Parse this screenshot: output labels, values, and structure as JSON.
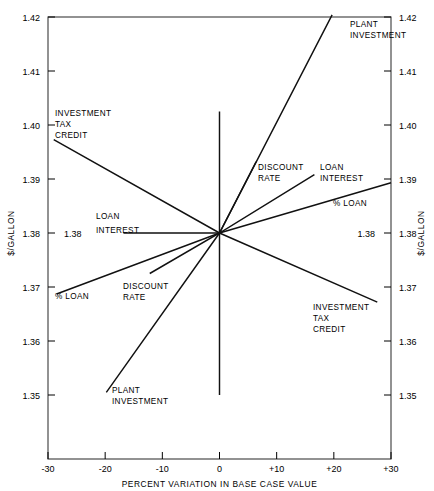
{
  "chart_data": {
    "type": "line",
    "title": "",
    "xlabel": "PERCENT VARIATION IN BASE CASE VALUE",
    "ylabel": "$/GALLON",
    "xlim": [
      -30,
      30
    ],
    "ylim": [
      1.3445,
      1.4225
    ],
    "grid": false,
    "legend_position": "inline-annotations",
    "x_ticks": [
      "-30",
      "-20",
      "-10",
      "0",
      "+10",
      "+20",
      "+30"
    ],
    "x_tick_values": [
      -30,
      -20,
      -10,
      0,
      10,
      20,
      30
    ],
    "y_ticks": [
      "1.35",
      "1.36",
      "1.37",
      "1.38",
      "1.39",
      "1.40",
      "1.41",
      "1.42"
    ],
    "y_tick_values": [
      1.35,
      1.36,
      1.37,
      1.38,
      1.39,
      1.4,
      1.41,
      1.42
    ],
    "base_case_value": 1.38,
    "base_case_label": "1.38",
    "series": [
      {
        "name": "PLANT INVESTMENT",
        "x": [
          -19.8,
          0,
          19.7
        ],
        "values": [
          1.3505,
          1.38,
          1.4204
        ],
        "label_left": "PLANT\nINVESTMENT",
        "label_right": "PLANT\nINVESTMENT"
      },
      {
        "name": "INVESTMENT TAX CREDIT",
        "x": [
          -29.0,
          0,
          27.6
        ],
        "values": [
          1.3973,
          1.38,
          1.3672
        ],
        "label_left": "INVESTMENT\nTAX\nCREDIT",
        "label_right": "INVESTMENT\nTAX\nCREDIT"
      },
      {
        "name": "DISCOUNT RATE",
        "x": [
          -12.2,
          0,
          6.4
        ],
        "values": [
          1.3725,
          1.38,
          1.3932
        ],
        "label_left": "DISCOUNT\nRATE",
        "label_right": "DISCOUNT\nRATE"
      },
      {
        "name": "LOAN INTEREST",
        "x": [
          -16.8,
          0,
          16.6
        ],
        "values": [
          1.38,
          1.38,
          1.3908
        ],
        "label_left": "LOAN\nINTEREST",
        "label_right": "LOAN\nINTEREST"
      },
      {
        "name": "% LOAN",
        "x": [
          -28.5,
          0,
          30.0
        ],
        "values": [
          1.3687,
          1.38,
          1.3893
        ],
        "label_left": "% LOAN",
        "label_right": "% LOAN"
      }
    ],
    "annotations": [
      {
        "text": "PLANT",
        "x": 350,
        "y": 27,
        "name": "plant-investment-label-right-1"
      },
      {
        "text": "INVESTMENT",
        "x": 350,
        "y": 38,
        "name": "plant-investment-label-right-2"
      },
      {
        "text": "INVESTMENT",
        "x": 55,
        "y": 116,
        "name": "investment-tax-credit-label-left-1"
      },
      {
        "text": "TAX",
        "x": 55,
        "y": 127,
        "name": "investment-tax-credit-label-left-2"
      },
      {
        "text": "CREDIT",
        "x": 55,
        "y": 138,
        "name": "investment-tax-credit-label-left-3"
      },
      {
        "text": "DISCOUNT",
        "x": 258,
        "y": 170,
        "name": "discount-rate-label-right-1"
      },
      {
        "text": "RATE",
        "x": 258,
        "y": 181,
        "name": "discount-rate-label-right-2"
      },
      {
        "text": "LOAN",
        "x": 320,
        "y": 170,
        "name": "loan-interest-label-right-1"
      },
      {
        "text": "INTEREST",
        "x": 320,
        "y": 181,
        "name": "loan-interest-label-right-2"
      },
      {
        "text": "% LOAN",
        "x": 333,
        "y": 206,
        "name": "percent-loan-label-right"
      },
      {
        "text": "LOAN",
        "x": 96,
        "y": 219,
        "name": "loan-interest-label-left-1"
      },
      {
        "text": "INTEREST",
        "x": 96,
        "y": 233,
        "name": "loan-interest-label-left-2"
      },
      {
        "text": "% LOAN",
        "x": 55,
        "y": 299,
        "name": "percent-loan-label-left"
      },
      {
        "text": "DISCOUNT",
        "x": 123,
        "y": 289,
        "name": "discount-rate-label-left-1"
      },
      {
        "text": "RATE",
        "x": 123,
        "y": 300,
        "name": "discount-rate-label-left-2"
      },
      {
        "text": "INVESTMENT",
        "x": 313,
        "y": 310,
        "name": "investment-tax-credit-label-right-1"
      },
      {
        "text": "TAX",
        "x": 313,
        "y": 321,
        "name": "investment-tax-credit-label-right-2"
      },
      {
        "text": "CREDIT",
        "x": 313,
        "y": 332,
        "name": "investment-tax-credit-label-right-3"
      },
      {
        "text": "PLANT",
        "x": 112,
        "y": 393,
        "name": "plant-investment-label-left-1"
      },
      {
        "text": "INVESTMENT",
        "x": 112,
        "y": 404,
        "name": "plant-investment-label-left-2"
      }
    ],
    "colors": {
      "line": "#111111",
      "frame": "#3a3a3a",
      "text": "#000000",
      "background": "#ffffff"
    }
  }
}
